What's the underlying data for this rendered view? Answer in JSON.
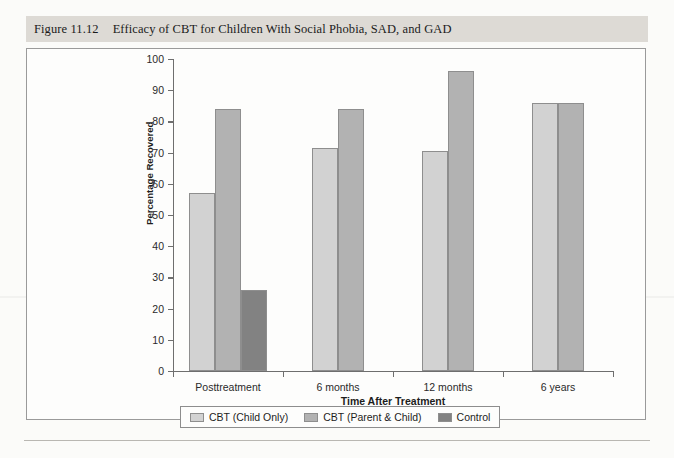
{
  "figure": {
    "label": "Figure 11.12",
    "title": "Efficacy of CBT for Children With Social Phobia, SAD, and GAD"
  },
  "chart_data": {
    "type": "bar",
    "title": "Efficacy of CBT for Children With Social Phobia, SAD, and GAD",
    "xlabel": "Time After Treatment",
    "ylabel": "Percentage Recovered",
    "categories": [
      "Posttreatment",
      "6 months",
      "12 months",
      "6 years"
    ],
    "ylim": [
      0,
      100
    ],
    "ytick_step": 10,
    "yticks": [
      0,
      10,
      20,
      30,
      40,
      50,
      60,
      70,
      80,
      90,
      100
    ],
    "ytick_labels": [
      "0",
      "10",
      "20",
      "30",
      "40",
      "50",
      "60",
      "70",
      "80",
      "90",
      "100"
    ],
    "grid": false,
    "legend_position": "bottom",
    "series": [
      {
        "name": "CBT (Child Only)",
        "color": "#d2d2d2",
        "values": [
          57,
          71.5,
          70.5,
          86
        ]
      },
      {
        "name": "CBT (Parent & Child)",
        "color": "#b2b2b2",
        "values": [
          84,
          84,
          96,
          86
        ]
      },
      {
        "name": "Control",
        "color": "#828282",
        "values": [
          26,
          null,
          null,
          null
        ]
      }
    ]
  }
}
